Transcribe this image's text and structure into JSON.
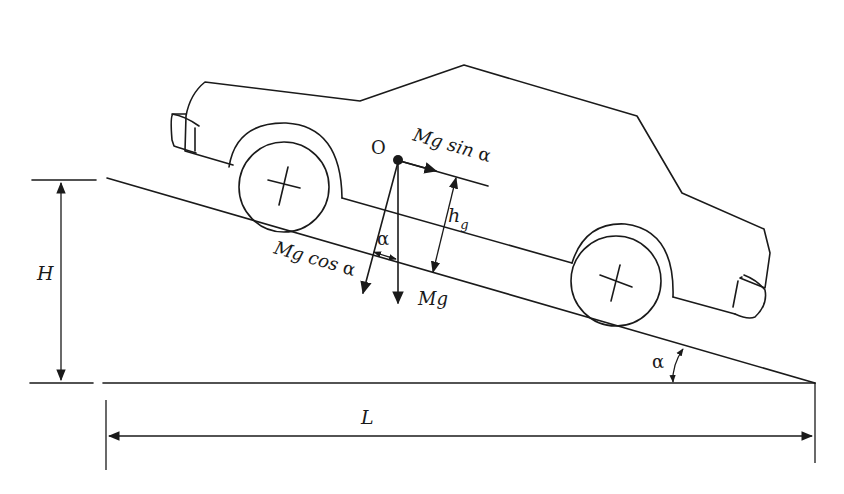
{
  "diagram": {
    "type": "vehicle-on-incline-free-body",
    "colors": {
      "stroke": "#1a1a1a",
      "background": "#ffffff"
    },
    "labels": {
      "center_of_gravity": "O",
      "force_parallel": "Mg sin α",
      "force_parallel_main": "Mg sin ",
      "force_parallel_angle": "α",
      "force_normal": "Mg cos α",
      "force_normal_main": "Mg cos ",
      "force_normal_angle": "α",
      "weight": "Mg",
      "cg_height_main": "h",
      "cg_height_sub": "g",
      "angle_between_forces": "α",
      "slope_angle": "α",
      "height": "H",
      "length": "L"
    }
  }
}
